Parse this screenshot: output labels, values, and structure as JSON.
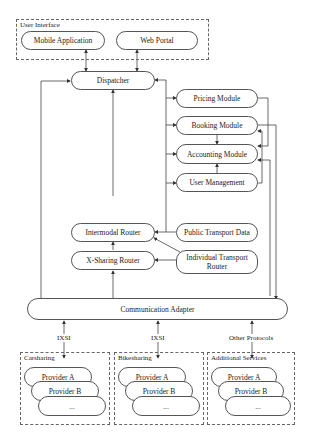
{
  "groups": {
    "user_interface": "User Interface",
    "carsharing": "Carsharing",
    "bikesharing": "Bikesharing",
    "additional": "Additional Services"
  },
  "nodes": {
    "mobile_app": "Mobile Application",
    "web_portal": "Web Portal",
    "dispatcher": "Dispatcher",
    "pricing": "Pricing Module",
    "booking": "Booking Module",
    "accounting": "Accounting Module",
    "user_mgmt": "User Management",
    "intermodal": "Intermodal Router",
    "xsharing": "X-Sharing Router",
    "public_transport": "Public Transport Data",
    "individual_transport": "Individual Transport Router",
    "comm_adapter": "Communication Adapter"
  },
  "protocols": [
    "IXSI",
    "IXSI",
    "Other Protocols"
  ],
  "providers": {
    "carsharing": [
      "Provider A",
      "Provider B",
      "..."
    ],
    "bikesharing": [
      "Provider A",
      "Provider B",
      "..."
    ],
    "additional": [
      "Provider A",
      "Provider B",
      "..."
    ]
  }
}
